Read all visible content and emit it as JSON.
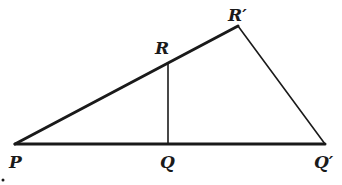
{
  "diagram": {
    "colors": {
      "stroke": "#1a1a1a",
      "background": "#ffffff"
    },
    "points": {
      "P": {
        "label": "P",
        "x": 15,
        "y": 144
      },
      "Q": {
        "label": "Q",
        "x": 168,
        "y": 144
      },
      "Qp": {
        "label": "Q′",
        "x": 325,
        "y": 144
      },
      "R": {
        "label": "R",
        "x": 168,
        "y": 63
      },
      "Rp": {
        "label": "R′",
        "x": 238,
        "y": 26
      }
    },
    "segments": [
      {
        "name": "PQprime",
        "from": "P",
        "to": "Qp",
        "weight": "thick"
      },
      {
        "name": "PRprime",
        "from": "P",
        "to": "Rp",
        "weight": "thick"
      },
      {
        "name": "RprimeQprime",
        "from": "Rp",
        "to": "Qp",
        "weight": "thin"
      },
      {
        "name": "RQ",
        "from": "R",
        "to": "Q",
        "weight": "thin"
      }
    ]
  }
}
